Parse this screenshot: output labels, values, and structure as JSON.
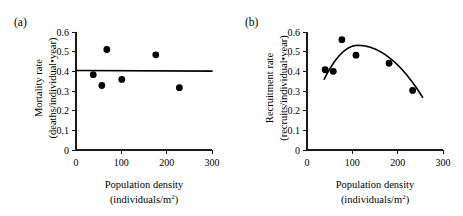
{
  "figure": {
    "panels": [
      "a",
      "b"
    ]
  },
  "chart_data": [
    {
      "type": "scatter",
      "panel_label": "(a)",
      "title": "",
      "xlabel": "Population density",
      "xlabel_sub": "(individuals/m",
      "xlabel_sub_sup": "2",
      "xlabel_sub_end": ")",
      "ylabel": "Mortality rate",
      "ylabel_sub": "(deaths/individual•year)",
      "xlim": [
        0,
        300
      ],
      "ylim": [
        0,
        0.6
      ],
      "xticks": [
        0,
        100,
        200,
        300
      ],
      "xtick_labels": [
        "0",
        "100",
        "200",
        "300"
      ],
      "yticks": [
        0,
        0.1,
        0.2,
        0.3,
        0.4,
        0.5,
        0.6
      ],
      "ytick_labels": [
        "0",
        "0.1",
        "0.2",
        "0.3",
        "0.4",
        "0.5",
        "0.6"
      ],
      "grid": false,
      "legend": false,
      "points": [
        {
          "x": 38,
          "y": 0.383
        },
        {
          "x": 57,
          "y": 0.328
        },
        {
          "x": 68,
          "y": 0.511
        },
        {
          "x": 101,
          "y": 0.359
        },
        {
          "x": 176,
          "y": 0.484
        },
        {
          "x": 228,
          "y": 0.317
        }
      ],
      "fit": {
        "kind": "linear",
        "description": "flat horizontal regression line, no density dependence",
        "x_start": 0,
        "x_end": 300,
        "y_start": 0.404,
        "y_end": 0.401
      }
    },
    {
      "type": "scatter",
      "panel_label": "(b)",
      "title": "",
      "xlabel": "Population density",
      "xlabel_sub": "(individuals/m",
      "xlabel_sub_sup": "2",
      "xlabel_sub_end": ")",
      "ylabel": "Recruitment rate",
      "ylabel_sub": "(recruits/individual•year)",
      "xlim": [
        0,
        300
      ],
      "ylim": [
        0,
        0.6
      ],
      "xticks": [
        0,
        100,
        200,
        300
      ],
      "xtick_labels": [
        "0",
        "100",
        "200",
        "300"
      ],
      "yticks": [
        0,
        0.1,
        0.2,
        0.3,
        0.4,
        0.5,
        0.6
      ],
      "ytick_labels": [
        "0",
        "0.1",
        "0.2",
        "0.3",
        "0.4",
        "0.5",
        "0.6"
      ],
      "grid": false,
      "legend": false,
      "points": [
        {
          "x": 40,
          "y": 0.408
        },
        {
          "x": 58,
          "y": 0.4
        },
        {
          "x": 77,
          "y": 0.561
        },
        {
          "x": 108,
          "y": 0.482
        },
        {
          "x": 181,
          "y": 0.441
        },
        {
          "x": 233,
          "y": 0.303
        }
      ],
      "fit": {
        "kind": "quadratic",
        "description": "hump-shaped curve peaking near density 110",
        "x_start": 38,
        "x_end": 255,
        "peak_x": 112,
        "peak_y": 0.532,
        "y_start": 0.36,
        "y_end": 0.268
      }
    }
  ]
}
